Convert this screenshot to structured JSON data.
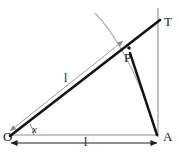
{
  "figure": {
    "type": "geometry-diagram",
    "background_color": "#ffffff",
    "stroke_colors": {
      "primary": "#111111",
      "secondary": "#999999",
      "arc": "#aaaaaa",
      "baseline": "#8a8a8a"
    },
    "points": {
      "O": {
        "label": "O",
        "x": 10,
        "y": 137
      },
      "A": {
        "label": "A",
        "x": 158,
        "y": 137
      },
      "T": {
        "label": "T",
        "x": 158,
        "y": 20
      },
      "P": {
        "label": "P",
        "x": 130,
        "y": 48
      }
    },
    "labels": {
      "origin": "O",
      "foot": "A",
      "top": "T",
      "mid": "P",
      "length_diagonal": "l",
      "length_base": "l",
      "angle": "x"
    },
    "segments": [
      {
        "name": "string-O-to-T",
        "from": "O",
        "to": "T",
        "style": "thick-black"
      },
      {
        "name": "chord-P-to-A",
        "from": "P",
        "to": "A",
        "style": "thick-black"
      },
      {
        "name": "vertical-through-A",
        "from": "T-top",
        "to": "A",
        "style": "thin-gray"
      },
      {
        "name": "baseline-O-to-A",
        "from": "O",
        "to": "A",
        "style": "thin-gray"
      }
    ],
    "arcs": [
      {
        "name": "bob-path-arc",
        "style": "gray",
        "from_xy": [
          95,
          13
        ],
        "to_xy": [
          158,
          132
        ]
      },
      {
        "name": "angle-arc-at-O",
        "style": "gray",
        "radius": 22
      }
    ],
    "dimension_arrows": [
      {
        "name": "diagonal-length-arrow",
        "label": "l",
        "double_headed": true,
        "orientation": "along-OP"
      },
      {
        "name": "base-length-arrow",
        "label": "l",
        "double_headed": true,
        "orientation": "horizontal"
      }
    ]
  }
}
